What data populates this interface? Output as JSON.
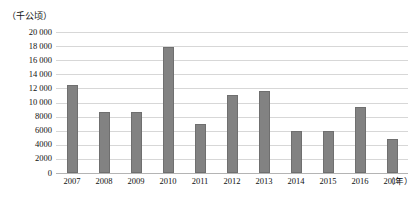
{
  "chart_data": {
    "type": "bar",
    "title": "",
    "subtitle": "",
    "xlabel": "（年）",
    "ylabel": "（千公顷）",
    "categories": [
      "2007",
      "2008",
      "2009",
      "2010",
      "2011",
      "2012",
      "2013",
      "2014",
      "2015",
      "2016",
      "2017"
    ],
    "values": [
      12500,
      8600,
      8700,
      17900,
      7000,
      11100,
      11600,
      5900,
      5900,
      9400,
      4800
    ],
    "ylim": [
      0,
      20000
    ],
    "ytick_step": 2000,
    "ytick_labels": [
      "0",
      "2000",
      "4000",
      "6000",
      "8000",
      "10 000",
      "12 000",
      "14 000",
      "16 000",
      "18 000",
      "20 000"
    ],
    "ytick_values": [
      0,
      2000,
      4000,
      6000,
      8000,
      10000,
      12000,
      14000,
      16000,
      18000,
      20000
    ],
    "grid": true,
    "legend": false,
    "legend_position": "none",
    "bar_color": "#828282",
    "bar_edge_color": "#6f6f6f",
    "gridline_color": "#d7d7d7",
    "axis_color": "#b4b4b4"
  }
}
